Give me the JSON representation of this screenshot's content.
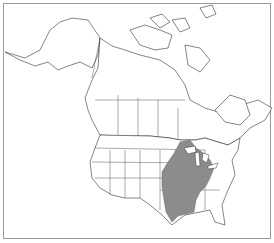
{
  "map": {
    "region": "North America (Canada, United States)",
    "type": "species range map",
    "colors": {
      "land": "#ffffff",
      "border": "#333333",
      "range_fill": "#8c8c8c",
      "frame": "#9a9a9a"
    },
    "highlighted_range": "Eastern and central United States"
  }
}
